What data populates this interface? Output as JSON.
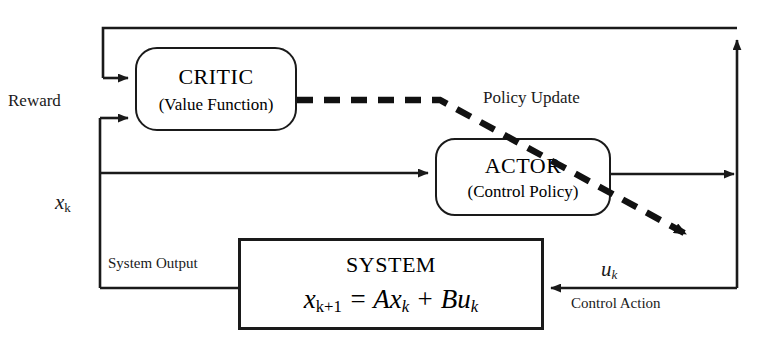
{
  "diagram": {
    "colors": {
      "stroke": "#1a1a1a",
      "background": "#ffffff",
      "dashed_stroke": "#111111"
    },
    "nodes": {
      "critic": {
        "title": "CRITIC",
        "subtitle": "(Value Function)",
        "shape": "rounded-rectangle"
      },
      "actor": {
        "title": "ACTOR",
        "subtitle": "(Control Policy)",
        "shape": "rounded-rectangle"
      },
      "system": {
        "title": "SYSTEM",
        "equation_lhs": "x",
        "equation_lhs_sub": "k+1",
        "equation_eq": " = ",
        "equation_A": "A",
        "equation_x": "x",
        "equation_x_sub": "k",
        "equation_plus": " + ",
        "equation_B": "B",
        "equation_u": "u",
        "equation_u_sub": "k",
        "equation_full": "x(k+1) = Ax(k) + Bu(k)",
        "shape": "rectangle"
      }
    },
    "edge_labels": {
      "reward": "Reward",
      "policy_update": "Policy Update",
      "state": "x",
      "state_sub": "k",
      "system_output": "System Output",
      "control": "u",
      "control_sub": "k",
      "control_action": "Control Action"
    }
  }
}
